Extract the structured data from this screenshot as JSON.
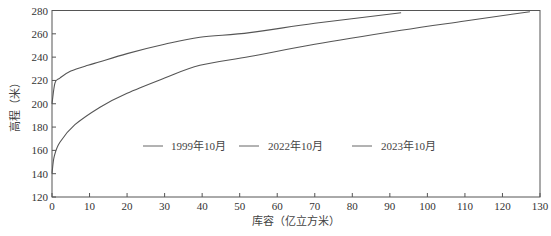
{
  "chart_data": {
    "type": "line",
    "title": "",
    "xlabel": "库容（亿立方米）",
    "ylabel": "高程（米）",
    "xlim": [
      0,
      130
    ],
    "ylim": [
      120,
      280
    ],
    "xticks": [
      0,
      10,
      20,
      30,
      40,
      50,
      60,
      70,
      80,
      90,
      100,
      110,
      120,
      130
    ],
    "yticks": [
      120,
      140,
      160,
      180,
      200,
      220,
      240,
      260,
      280
    ],
    "grid": false,
    "legend_position": "inside-center",
    "legend": [
      "1999年10月",
      "2022年10月",
      "2023年10月"
    ],
    "series": [
      {
        "name": "upper-curve",
        "color": "#555555",
        "points": [
          [
            0,
            200
          ],
          [
            0.8,
            218
          ],
          [
            2.1,
            222
          ],
          [
            5,
            228
          ],
          [
            9.6,
            233
          ],
          [
            12.8,
            236
          ],
          [
            20,
            243
          ],
          [
            30,
            251
          ],
          [
            39.4,
            257
          ],
          [
            52.7,
            261
          ],
          [
            70,
            269
          ],
          [
            93,
            278
          ]
        ]
      },
      {
        "name": "lower-curve",
        "color": "#555555",
        "points": [
          [
            0,
            140
          ],
          [
            0.6,
            155
          ],
          [
            2.1,
            167
          ],
          [
            6.1,
            182
          ],
          [
            12.8,
            197
          ],
          [
            20,
            209
          ],
          [
            30,
            222
          ],
          [
            39.4,
            233
          ],
          [
            52.7,
            240.5
          ],
          [
            70,
            251
          ],
          [
            93,
            263
          ],
          [
            110,
            271
          ],
          [
            127.3,
            279
          ]
        ]
      }
    ]
  },
  "legend_items": [
    {
      "label": "1999年10月",
      "line_x": 143,
      "label_x": 171
    },
    {
      "label": "2022年10月",
      "line_x": 239,
      "label_x": 268
    },
    {
      "label": "2023年10月",
      "line_x": 352,
      "label_x": 381
    }
  ]
}
